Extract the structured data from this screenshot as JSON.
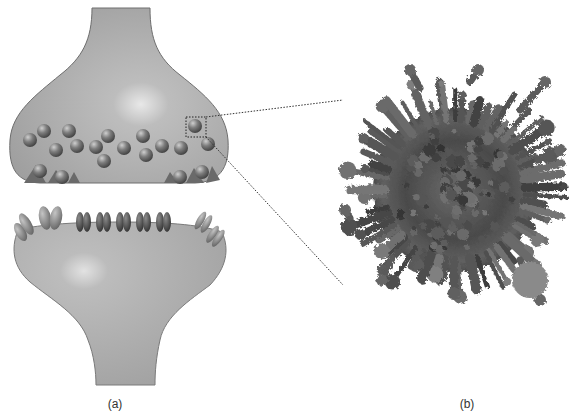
{
  "figure": {
    "panels": [
      {
        "id": "a",
        "label": "(a)",
        "description": "Schematic of a chemical synapse: presynaptic terminal with synaptic vesicles, postsynaptic cell with receptors",
        "presynaptic": {
          "vesicles": [
            {
              "cx": 30,
              "cy": 140
            },
            {
              "cx": 44,
              "cy": 131
            },
            {
              "cx": 56,
              "cy": 150
            },
            {
              "cx": 69,
              "cy": 131
            },
            {
              "cx": 77,
              "cy": 146
            },
            {
              "cx": 96,
              "cy": 147
            },
            {
              "cx": 108,
              "cy": 136
            },
            {
              "cx": 104,
              "cy": 161
            },
            {
              "cx": 124,
              "cy": 148
            },
            {
              "cx": 143,
              "cy": 136
            },
            {
              "cx": 146,
              "cy": 155
            },
            {
              "cx": 162,
              "cy": 146
            },
            {
              "cx": 181,
              "cy": 148
            },
            {
              "cx": 208,
              "cy": 144
            },
            {
              "cx": 195,
              "cy": 126
            }
          ],
          "docked_vesicles": [
            {
              "cx": 40,
              "cy": 171
            },
            {
              "cx": 62,
              "cy": 177
            },
            {
              "cx": 180,
              "cy": 177
            },
            {
              "cx": 202,
              "cy": 172
            }
          ],
          "highlight_box": {
            "x": 186,
            "y": 117,
            "w": 20,
            "h": 20
          }
        },
        "postsynaptic": {
          "receptor_groups": 5,
          "left_receptors": 2,
          "right_receptors": 2
        }
      },
      {
        "id": "b",
        "label": "(b)",
        "description": "Molecular model of a single synaptic vesicle"
      }
    ],
    "zoom_lines": [
      {
        "x1": 206,
        "y1": 117,
        "x2": 343,
        "y2": 100
      },
      {
        "x1": 206,
        "y1": 137,
        "x2": 343,
        "y2": 285
      }
    ],
    "colors": {
      "cell_fill": "#a9a9a9",
      "cell_stroke": "#6e6e6e",
      "vesicle": "#7a7a7a",
      "receptor_dark": "#454545",
      "receptor_mid": "#8a8a8a",
      "molecule_dark": "#3e3e3e"
    }
  }
}
